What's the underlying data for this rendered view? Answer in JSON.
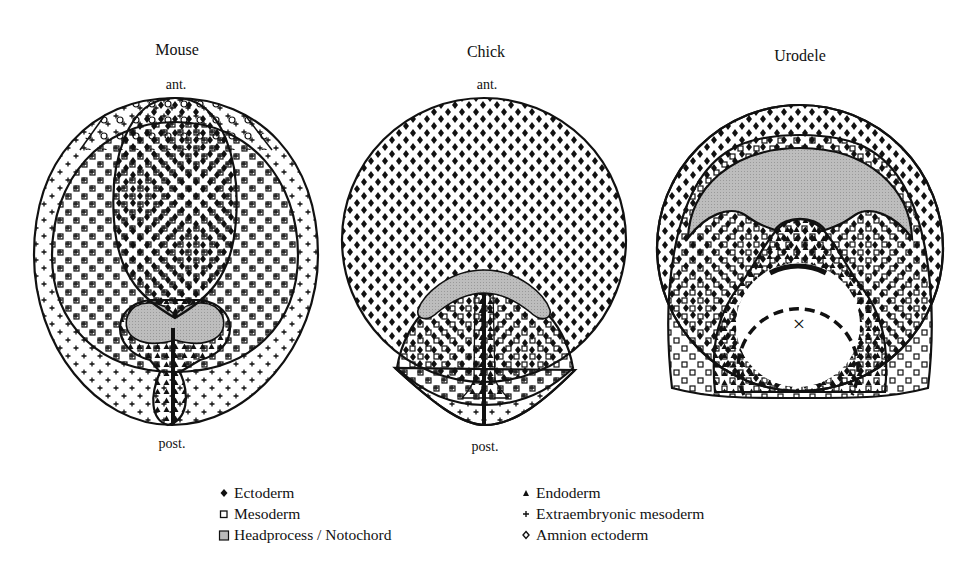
{
  "diagrams": [
    {
      "title": "Mouse",
      "top_label": "ant.",
      "bottom_label": "post."
    },
    {
      "title": "Chick",
      "top_label": "ant.",
      "bottom_label": "post."
    },
    {
      "title": "Urodele"
    }
  ],
  "urodele_marker": "×",
  "legend": {
    "left": [
      {
        "symbol": "filled-diamond",
        "label": "Ectoderm"
      },
      {
        "symbol": "open-square",
        "label": "Mesoderm"
      },
      {
        "symbol": "gray-filled-square",
        "label": "Headprocess / Notochord"
      }
    ],
    "right": [
      {
        "symbol": "filled-triangle",
        "label": "Endoderm"
      },
      {
        "symbol": "plus",
        "label": "Extraembryonic mesoderm"
      },
      {
        "symbol": "open-diamond",
        "label": "Amnion ectoderm"
      }
    ]
  },
  "colors": {
    "line": "#111111",
    "notochord_fill": "#b8b8b8",
    "background": "#ffffff"
  }
}
